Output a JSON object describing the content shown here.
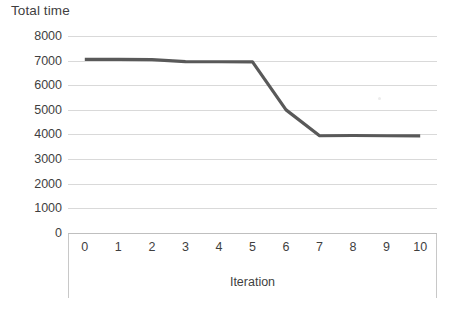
{
  "chart_data": {
    "type": "line",
    "title": "Total time",
    "xlabel": "Iteration",
    "ylabel": "",
    "x": [
      0,
      1,
      2,
      3,
      4,
      5,
      6,
      7,
      8,
      9,
      10
    ],
    "categories": [
      "0",
      "1",
      "2",
      "3",
      "4",
      "5",
      "6",
      "7",
      "8",
      "9",
      "10"
    ],
    "values": [
      7050,
      7050,
      7040,
      6960,
      6955,
      6950,
      5000,
      3950,
      3960,
      3950,
      3945
    ],
    "series": [
      {
        "name": "Total time",
        "values": [
          7050,
          7050,
          7040,
          6960,
          6955,
          6950,
          5000,
          3950,
          3960,
          3950,
          3945
        ],
        "color": "#595959"
      }
    ],
    "ylim": [
      0,
      8000
    ],
    "xlim": [
      0,
      10
    ],
    "y_ticks": [
      8000,
      7000,
      6000,
      5000,
      4000,
      3000,
      2000,
      1000,
      0
    ],
    "y_tick_labels": [
      "8000",
      "7000",
      "6000",
      "5000",
      "4000",
      "3000",
      "2000",
      "1000",
      "0"
    ],
    "x_tick_labels": [
      "0",
      "1",
      "2",
      "3",
      "4",
      "5",
      "6",
      "7",
      "8",
      "9",
      "10"
    ],
    "grid": "horizontal",
    "gridline_color": "#d9d9d9",
    "legend": "none",
    "legend_position": "none",
    "background_color": "#ffffff",
    "line_color": "#595959",
    "line_width": 3,
    "markers": "none",
    "annotations": []
  },
  "axes": {
    "y_axis_name": "total-time-axis",
    "x_axis_name": "iteration-axis"
  }
}
